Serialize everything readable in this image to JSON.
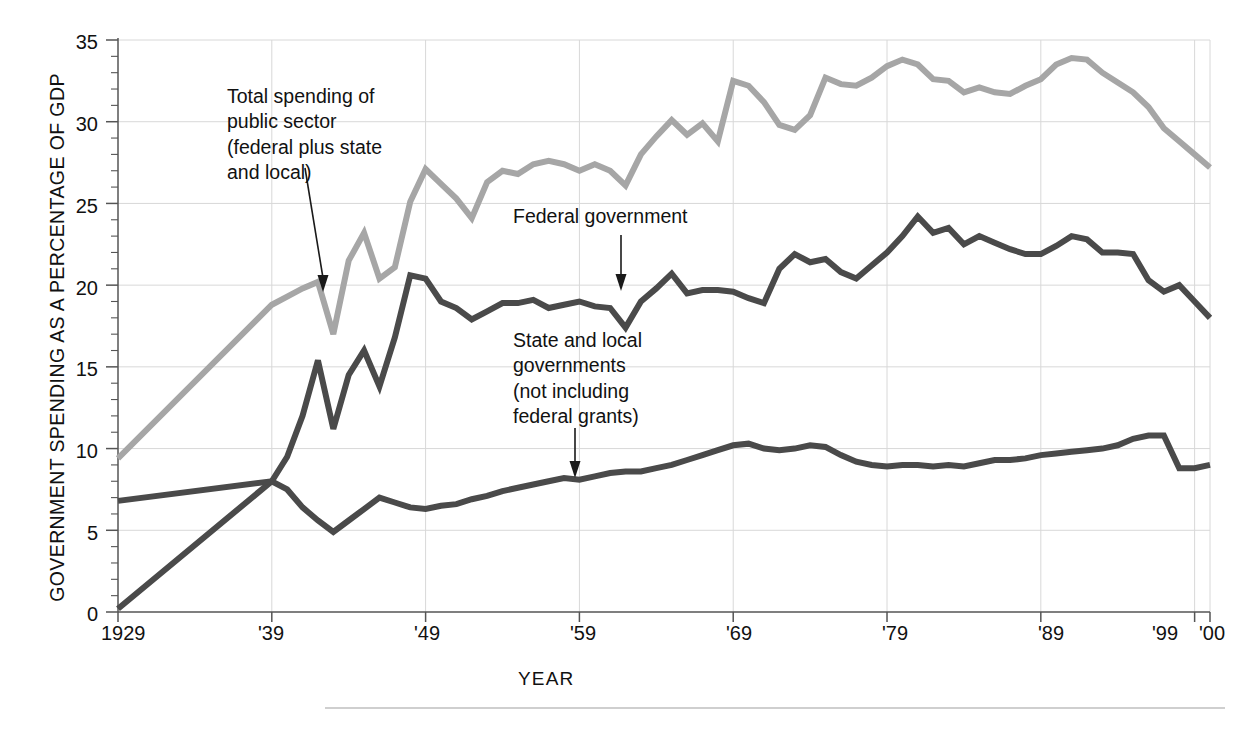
{
  "chart_data": {
    "type": "line",
    "title": "",
    "xlabel": "YEAR",
    "ylabel": "GOVERNMENT SPENDING AS A PERCENTAGE OF GDP",
    "xlim": [
      1929,
      2000
    ],
    "ylim": [
      0,
      35
    ],
    "grid": true,
    "legend_position": "inline-annotations",
    "y_ticks": [
      0,
      5,
      10,
      15,
      20,
      25,
      30,
      35
    ],
    "y_tick_labels": [
      "0",
      "5",
      "10",
      "15",
      "20",
      "25",
      "30",
      "35"
    ],
    "y_minor_tick_interval": 1,
    "x_ticks": [
      1929,
      1939,
      1949,
      1959,
      1969,
      1979,
      1989,
      1999,
      2000
    ],
    "x_tick_labels": [
      "1929",
      "'39",
      "'49",
      "'59",
      "'69",
      "'79",
      "'89",
      "'99",
      "'00"
    ],
    "series": [
      {
        "name": "Total spending of public sector (federal plus state and local)",
        "color": "#a6a6a6",
        "x": [
          1929,
          1939,
          1940,
          1941,
          1942,
          1943,
          1944,
          1945,
          1946,
          1947,
          1948,
          1949,
          1950,
          1951,
          1952,
          1953,
          1954,
          1955,
          1956,
          1957,
          1958,
          1959,
          1960,
          1961,
          1962,
          1963,
          1964,
          1965,
          1966,
          1967,
          1968,
          1969,
          1970,
          1971,
          1972,
          1973,
          1974,
          1975,
          1976,
          1977,
          1978,
          1979,
          1980,
          1981,
          1982,
          1983,
          1984,
          1985,
          1986,
          1987,
          1988,
          1989,
          1990,
          1991,
          1992,
          1993,
          1994,
          1995,
          1996,
          1997,
          1998,
          1999,
          2000
        ],
        "values": [
          9.4,
          18.8,
          19.3,
          19.8,
          20.2,
          17.0,
          21.5,
          23.2,
          20.4,
          21.1,
          25.1,
          27.1,
          26.2,
          25.3,
          24.1,
          26.3,
          27.0,
          26.8,
          27.4,
          27.6,
          27.4,
          27.0,
          27.4,
          27.0,
          26.1,
          28.0,
          29.1,
          30.1,
          29.2,
          29.9,
          28.8,
          32.5,
          32.2,
          31.2,
          29.8,
          29.5,
          30.4,
          32.7,
          32.3,
          32.2,
          32.7,
          33.4,
          33.8,
          33.5,
          32.6,
          32.5,
          31.8,
          32.1,
          31.8,
          31.7,
          32.2,
          32.6,
          33.5,
          33.9,
          33.8,
          33.0,
          32.4,
          31.8,
          30.9,
          29.6,
          28.8,
          28.0,
          27.2
        ]
      },
      {
        "name": "Federal government",
        "color": "#4a4a4a",
        "x": [
          1929,
          1939,
          1940,
          1941,
          1942,
          1943,
          1944,
          1945,
          1946,
          1947,
          1948,
          1949,
          1950,
          1951,
          1952,
          1953,
          1954,
          1955,
          1956,
          1957,
          1958,
          1959,
          1960,
          1961,
          1962,
          1963,
          1964,
          1965,
          1966,
          1967,
          1968,
          1969,
          1970,
          1971,
          1972,
          1973,
          1974,
          1975,
          1976,
          1977,
          1978,
          1979,
          1980,
          1981,
          1982,
          1983,
          1984,
          1985,
          1986,
          1987,
          1988,
          1989,
          1990,
          1991,
          1992,
          1993,
          1994,
          1995,
          1996,
          1997,
          1998,
          1999,
          2000
        ],
        "values": [
          0.2,
          8.0,
          9.5,
          12.0,
          15.4,
          11.2,
          14.5,
          16.0,
          13.8,
          16.8,
          20.6,
          20.4,
          19.0,
          18.6,
          17.9,
          18.4,
          18.9,
          18.9,
          19.1,
          18.6,
          18.8,
          19.0,
          18.7,
          18.6,
          17.4,
          19.0,
          19.8,
          20.7,
          19.5,
          19.7,
          19.7,
          19.6,
          19.2,
          18.9,
          21.0,
          21.9,
          21.4,
          21.6,
          20.8,
          20.4,
          21.2,
          22.0,
          23.0,
          24.2,
          23.2,
          23.5,
          22.5,
          23.0,
          22.6,
          22.2,
          21.9,
          21.9,
          22.4,
          23.0,
          22.8,
          22.0,
          22.0,
          21.9,
          20.3,
          19.6,
          20.0,
          19.0,
          18.0
        ]
      },
      {
        "name": "State and local governments (not including federal grants)",
        "color": "#4a4a4a",
        "x": [
          1929,
          1939,
          1940,
          1941,
          1942,
          1943,
          1944,
          1945,
          1946,
          1947,
          1948,
          1949,
          1950,
          1951,
          1952,
          1953,
          1954,
          1955,
          1956,
          1957,
          1958,
          1959,
          1960,
          1961,
          1962,
          1963,
          1964,
          1965,
          1966,
          1967,
          1968,
          1969,
          1970,
          1971,
          1972,
          1973,
          1974,
          1975,
          1976,
          1977,
          1978,
          1979,
          1980,
          1981,
          1982,
          1983,
          1984,
          1985,
          1986,
          1987,
          1988,
          1989,
          1990,
          1991,
          1992,
          1993,
          1994,
          1995,
          1996,
          1997,
          1998,
          1999,
          2000
        ],
        "values": [
          6.8,
          8.0,
          7.5,
          6.4,
          5.6,
          4.9,
          5.6,
          6.3,
          7.0,
          6.7,
          6.4,
          6.3,
          6.5,
          6.6,
          6.9,
          7.1,
          7.4,
          7.6,
          7.8,
          8.0,
          8.2,
          8.1,
          8.3,
          8.5,
          8.6,
          8.6,
          8.8,
          9.0,
          9.3,
          9.6,
          9.9,
          10.2,
          10.3,
          10.0,
          9.9,
          10.0,
          10.2,
          10.1,
          9.6,
          9.2,
          9.0,
          8.9,
          9.0,
          9.0,
          8.9,
          9.0,
          8.9,
          9.1,
          9.3,
          9.3,
          9.4,
          9.6,
          9.7,
          9.8,
          9.9,
          10.0,
          10.2,
          10.6,
          10.8,
          10.8,
          8.8,
          8.8,
          9.0
        ]
      }
    ],
    "annotations": [
      {
        "id": "total-spending",
        "text": "Total spending of\npublic sector\n(federal plus state\nand local)",
        "arrow": true
      },
      {
        "id": "federal-government",
        "text": "Federal government",
        "arrow": true
      },
      {
        "id": "state-local",
        "text": "State and local\ngovernments\n(not including\nfederal grants)",
        "arrow": true
      }
    ],
    "colors": {
      "total": "#a6a6a6",
      "federal": "#4a4a4a",
      "state_local": "#4a4a4a",
      "axis": "#555555",
      "grid": "#d8d8d8"
    }
  }
}
